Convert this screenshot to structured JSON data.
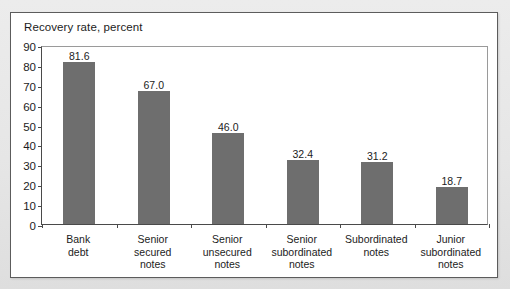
{
  "chart_data": {
    "type": "bar",
    "title": "Recovery rate, percent",
    "xlabel": "",
    "ylabel": "Recovery rate, percent",
    "ylim": [
      0,
      90
    ],
    "ytick_step": 10,
    "grid": false,
    "legend": "none",
    "bar_color": "#6e6e6e",
    "categories": [
      "Bank debt",
      "Senior secured notes",
      "Senior unsecured notes",
      "Senior subordinated notes",
      "Subordinated notes",
      "Junior subordinated notes"
    ],
    "category_lines": [
      [
        "Bank",
        "debt"
      ],
      [
        "Senior",
        "secured",
        "notes"
      ],
      [
        "Senior",
        "unsecured",
        "notes"
      ],
      [
        "Senior",
        "subordinated",
        "notes"
      ],
      [
        "Subordinated",
        "notes"
      ],
      [
        "Junior",
        "subordinated",
        "notes"
      ]
    ],
    "values": [
      81.6,
      67.0,
      46.0,
      32.4,
      31.2,
      18.7
    ],
    "value_labels": [
      "81.6",
      "67.0",
      "46.0",
      "32.4",
      "31.2",
      "18.7"
    ],
    "ytick_labels": [
      "90",
      "80",
      "70",
      "60",
      "50",
      "40",
      "30",
      "20",
      "10",
      "0"
    ],
    "ytick_values": [
      90,
      80,
      70,
      60,
      50,
      40,
      30,
      20,
      10,
      0
    ]
  }
}
